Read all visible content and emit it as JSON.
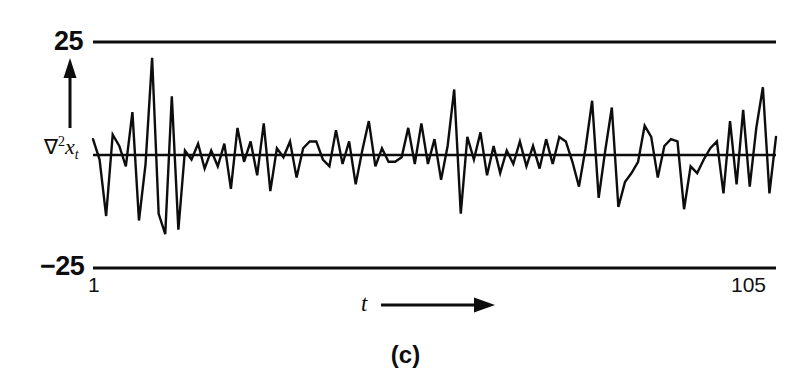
{
  "figure": {
    "caption": "(c)",
    "ink_color": "#0d0d0d",
    "background_color": "#ffffff"
  },
  "axes": {
    "y_axis_label": {
      "operator": "∇",
      "exponent": "2",
      "variable": "x",
      "subscript": "t",
      "plain": "∇²x_t"
    },
    "x_axis_label": "t",
    "x_axis_arrow": "right-arrow",
    "y_axis_arrow": "up-arrow",
    "upper_limit_label": "25",
    "lower_limit_label": "−25",
    "tick_start_label": "1",
    "tick_end_label": "105"
  },
  "chart_data": {
    "type": "line",
    "title": "(c)",
    "xlabel": "t",
    "ylabel": "∇²x_t",
    "xlim": [
      1,
      105
    ],
    "ylim": [
      -25,
      25
    ],
    "yticks": [
      -25,
      25
    ],
    "ytick_labels": [
      "−25",
      "25"
    ],
    "xticks": [
      1,
      105
    ],
    "xtick_labels": [
      "1",
      "105"
    ],
    "grid": false,
    "legend": "none",
    "reference_lines": [
      25,
      0,
      -25
    ],
    "series": [
      {
        "name": "∇²x_t",
        "color": "#0d0d0d",
        "x": [
          1,
          2,
          3,
          4,
          5,
          6,
          7,
          8,
          9,
          10,
          11,
          12,
          13,
          14,
          15,
          16,
          17,
          18,
          19,
          20,
          21,
          22,
          23,
          24,
          25,
          26,
          27,
          28,
          29,
          30,
          31,
          32,
          33,
          34,
          35,
          36,
          37,
          38,
          39,
          40,
          41,
          42,
          43,
          44,
          45,
          46,
          47,
          48,
          49,
          50,
          51,
          52,
          53,
          54,
          55,
          56,
          57,
          58,
          59,
          60,
          61,
          62,
          63,
          64,
          65,
          66,
          67,
          68,
          69,
          70,
          71,
          72,
          73,
          74,
          75,
          76,
          77,
          78,
          79,
          80,
          81,
          82,
          83,
          84,
          85,
          86,
          87,
          88,
          89,
          90,
          91,
          92,
          93,
          94,
          95,
          96,
          97,
          98,
          99,
          100,
          101,
          102,
          103,
          104,
          105
        ],
        "values": [
          3.5,
          -1.0,
          -13.5,
          4.5,
          2.0,
          -2.5,
          9.5,
          -14.5,
          -2.0,
          21.5,
          -13.0,
          -17.5,
          13.0,
          -16.5,
          1.0,
          -1.0,
          2.5,
          -3.0,
          1.0,
          -2.5,
          2.5,
          -7.5,
          6.0,
          -1.5,
          3.0,
          -4.5,
          7.0,
          -8.0,
          1.5,
          -0.5,
          3.0,
          -5.0,
          1.5,
          3.0,
          3.0,
          -1.0,
          -2.5,
          5.5,
          -2.0,
          3.0,
          -6.5,
          1.0,
          7.5,
          -2.5,
          1.5,
          -1.5,
          -1.5,
          -0.5,
          6.0,
          -2.0,
          7.0,
          -2.0,
          3.5,
          -5.5,
          2.0,
          14.5,
          -13.0,
          4.0,
          -1.0,
          5.0,
          -4.5,
          2.0,
          -4.0,
          1.0,
          -2.0,
          3.0,
          -2.5,
          2.0,
          -3.0,
          3.5,
          -2.0,
          4.0,
          3.0,
          -1.5,
          -7.0,
          1.5,
          12.0,
          -9.5,
          1.0,
          10.5,
          -11.5,
          -6.0,
          -4.0,
          -1.5,
          6.5,
          4.0,
          -5.0,
          2.0,
          3.5,
          3.0,
          -12.0,
          -2.5,
          -4.0,
          -1.0,
          1.5,
          3.0,
          -8.5,
          7.5,
          -6.5,
          10.0,
          -7.0,
          6.0,
          15.0,
          -8.5,
          4.0
        ]
      }
    ]
  }
}
